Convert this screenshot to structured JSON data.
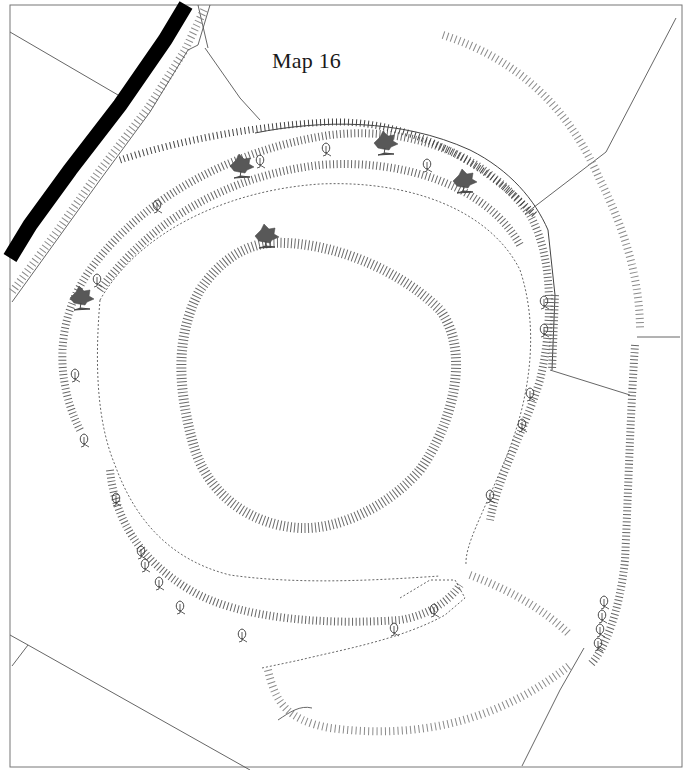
{
  "map": {
    "title": "Map 16",
    "style": {
      "road_color": "#000000",
      "hachure_color": "#6a6a6a",
      "boundary_color": "#555555",
      "tree_conifer_color": "#555555",
      "tree_deciduous_color": "#333333",
      "background": "#ffffff"
    },
    "features": {
      "road": "black-road",
      "outer_bank": "outer-rampart",
      "inner_bank": "inner-rampart",
      "annex": "southern-annex",
      "outer_scarp": "outer-scarp-arc"
    },
    "symbols": {
      "evergreen_tree_count": 6,
      "deciduous_tree_count": 30
    }
  }
}
